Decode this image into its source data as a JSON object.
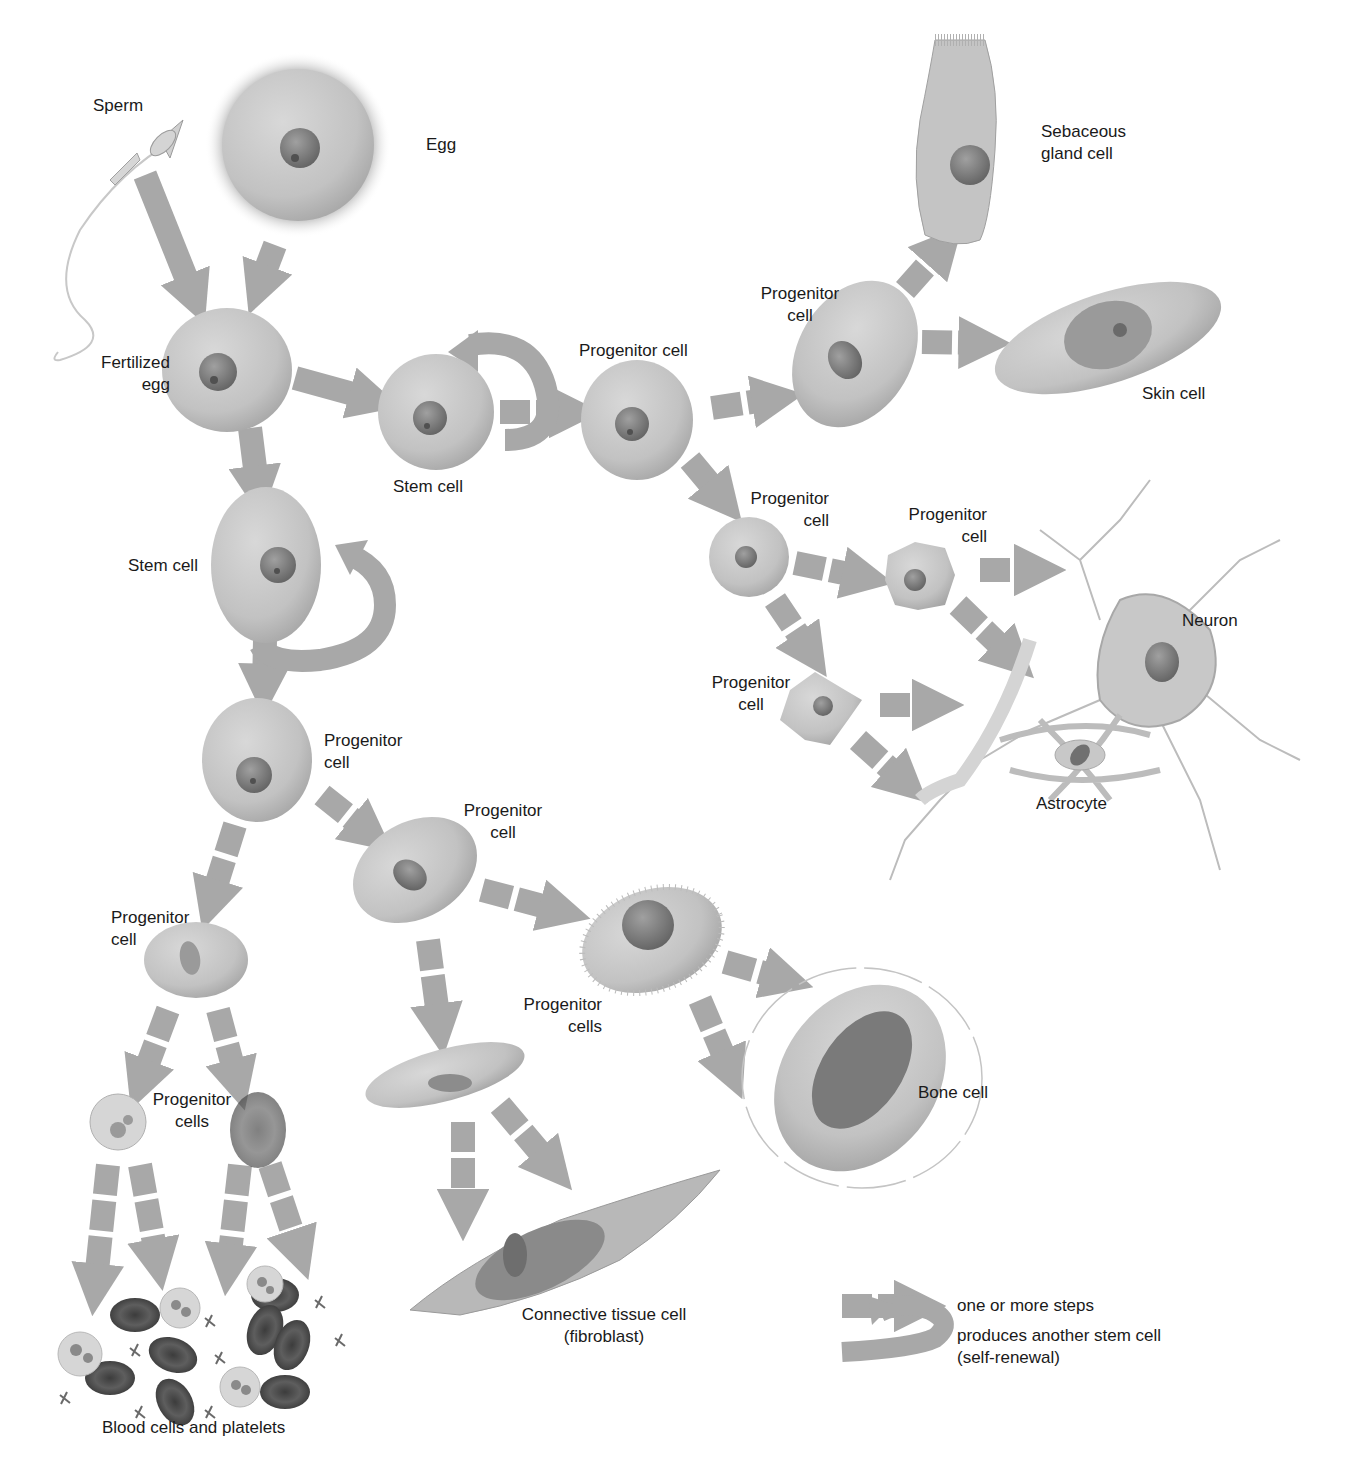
{
  "diagram": {
    "colors": {
      "background": "#ffffff",
      "arrow": "#a8a8a8",
      "cell_fill": "#c6c6c6",
      "cell_shadow": "#9c9c9c",
      "nucleus": "#7a7a7a",
      "nucleolus": "#5a5a5a",
      "text": "#1a1a1a",
      "red_blood_cell": "#5c5c5c"
    },
    "labels": {
      "sperm": "Sperm",
      "egg": "Egg",
      "fertilized_egg": [
        "Fertilized",
        "egg"
      ],
      "stem_cell_center": "Stem cell",
      "stem_cell_left": "Stem cell",
      "progenitor_top_row": "Progenitor cell",
      "progenitor_skin": [
        "Progenitor",
        "cell"
      ],
      "sebaceous": [
        "Sebaceous",
        "gland cell"
      ],
      "skin_cell": "Skin cell",
      "progenitor_neural_1": [
        "Progenitor",
        "cell"
      ],
      "progenitor_neural_2": [
        "Progenitor",
        "cell"
      ],
      "progenitor_neural_3": [
        "Progenitor",
        "cell"
      ],
      "neuron": "Neuron",
      "astrocyte": "Astrocyte",
      "progenitor_mid_left": [
        "Progenitor",
        "cell"
      ],
      "progenitor_mid_right": [
        "Progenitor",
        "cell"
      ],
      "progenitor_blood": [
        "Progenitor",
        "cell"
      ],
      "progenitor_blood_cells": [
        "Progenitor",
        "cells"
      ],
      "progenitor_connective": [
        "Progenitor",
        "cells"
      ],
      "bone_cell": "Bone cell",
      "connective_tissue": [
        "Connective tissue cell",
        "(fibroblast)"
      ],
      "blood_cells": "Blood cells and platelets"
    },
    "legend": {
      "dashed_arrow": "one or more steps",
      "curved_arrow": [
        "produces another stem cell",
        "(self-renewal)"
      ]
    }
  }
}
